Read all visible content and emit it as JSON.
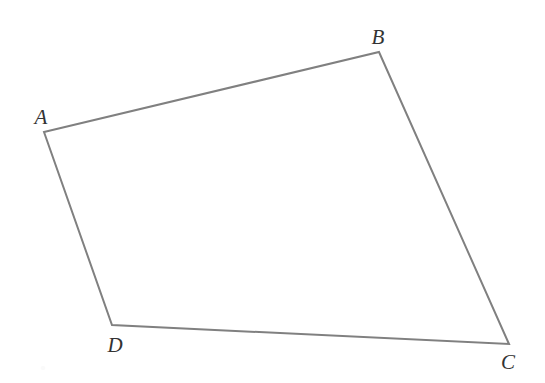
{
  "figure": {
    "kind": "quadrilateral",
    "name": "ABCD",
    "canvas": {
      "width": 545,
      "height": 383
    },
    "background_color": "#ffffff",
    "stroke_color": "#808080",
    "stroke_width": 2,
    "label_color": "#333333",
    "label_font_size": 21,
    "label_style": "italic-serif",
    "vertices": [
      {
        "id": "A",
        "label": "A",
        "x": 44,
        "y": 132,
        "label_x": 41,
        "label_y": 117
      },
      {
        "id": "B",
        "label": "B",
        "x": 379,
        "y": 52,
        "label_x": 378,
        "label_y": 37
      },
      {
        "id": "C",
        "label": "C",
        "x": 509,
        "y": 344,
        "label_x": 508,
        "label_y": 362
      },
      {
        "id": "D",
        "label": "D",
        "x": 112,
        "y": 325,
        "label_x": 115,
        "label_y": 345
      }
    ],
    "edges": [
      {
        "id": "AB",
        "from": "A",
        "to": "B"
      },
      {
        "id": "BC",
        "from": "B",
        "to": "C"
      },
      {
        "id": "CD",
        "from": "C",
        "to": "D"
      },
      {
        "id": "DA",
        "from": "D",
        "to": "A"
      }
    ],
    "path": "M 44 132 L 379 52 L 509 344 L 112 325 Z",
    "artifacts": [
      {
        "id": "speck-1",
        "x": 43,
        "y": 368
      }
    ]
  }
}
